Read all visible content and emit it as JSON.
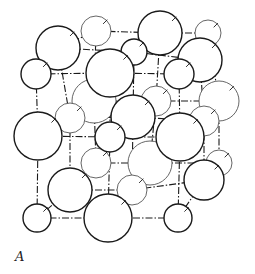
{
  "figure": {
    "label": "A",
    "stroke_color": "#1a1a1a",
    "thin_stroke_color": "#555555"
  },
  "bonds": [
    [
      36,
      74,
      110,
      73
    ],
    [
      110,
      73,
      179,
      74
    ],
    [
      36,
      74,
      38,
      136
    ],
    [
      110,
      73,
      110,
      137
    ],
    [
      179,
      74,
      180,
      137
    ],
    [
      38,
      136,
      110,
      137
    ],
    [
      110,
      137,
      180,
      137
    ],
    [
      38,
      136,
      37,
      218
    ],
    [
      110,
      137,
      108,
      218
    ],
    [
      180,
      137,
      178,
      218
    ],
    [
      37,
      218,
      108,
      218
    ],
    [
      108,
      218,
      178,
      218
    ],
    [
      58,
      48,
      134,
      52
    ],
    [
      134,
      52,
      200,
      60
    ],
    [
      96,
      31,
      160,
      33
    ],
    [
      160,
      33,
      208,
      33
    ],
    [
      58,
      48,
      96,
      31
    ],
    [
      134,
      52,
      160,
      33
    ],
    [
      200,
      60,
      208,
      33
    ],
    [
      94,
      101,
      156,
      101
    ],
    [
      156,
      101,
      219,
      101
    ],
    [
      70,
      118,
      133,
      117
    ],
    [
      133,
      117,
      204,
      121
    ],
    [
      58,
      48,
      70,
      118
    ],
    [
      134,
      52,
      133,
      117
    ],
    [
      200,
      60,
      204,
      121
    ],
    [
      96,
      31,
      94,
      101
    ],
    [
      160,
      33,
      156,
      101
    ],
    [
      208,
      33,
      219,
      101
    ],
    [
      70,
      118,
      70,
      190
    ],
    [
      133,
      117,
      132,
      190
    ],
    [
      204,
      121,
      204,
      180
    ],
    [
      94,
      101,
      96,
      163
    ],
    [
      156,
      101,
      150,
      163
    ],
    [
      219,
      101,
      219,
      163
    ],
    [
      70,
      190,
      132,
      190
    ],
    [
      132,
      190,
      204,
      180
    ],
    [
      96,
      163,
      150,
      163
    ],
    [
      150,
      163,
      219,
      163
    ],
    [
      36,
      74,
      58,
      48
    ],
    [
      110,
      73,
      134,
      52
    ],
    [
      179,
      74,
      200,
      60
    ],
    [
      38,
      136,
      70,
      118
    ],
    [
      110,
      137,
      133,
      117
    ],
    [
      180,
      137,
      204,
      121
    ],
    [
      37,
      218,
      70,
      190
    ],
    [
      108,
      218,
      132,
      190
    ],
    [
      178,
      218,
      204,
      180
    ]
  ],
  "atoms": [
    {
      "cx": 96,
      "cy": 31,
      "r": 15,
      "layer": "back",
      "weight": "thin"
    },
    {
      "cx": 208,
      "cy": 33,
      "r": 13,
      "layer": "back",
      "weight": "thin"
    },
    {
      "cx": 160,
      "cy": 33,
      "r": 22,
      "layer": "back",
      "weight": "bold"
    },
    {
      "cx": 94,
      "cy": 101,
      "r": 22,
      "layer": "back",
      "weight": "thin"
    },
    {
      "cx": 156,
      "cy": 101,
      "r": 15,
      "layer": "back",
      "weight": "thin"
    },
    {
      "cx": 219,
      "cy": 101,
      "r": 20,
      "layer": "back",
      "weight": "thin"
    },
    {
      "cx": 96,
      "cy": 163,
      "r": 15,
      "layer": "back",
      "weight": "thin"
    },
    {
      "cx": 150,
      "cy": 163,
      "r": 22,
      "layer": "back",
      "weight": "thin"
    },
    {
      "cx": 219,
      "cy": 163,
      "r": 13,
      "layer": "back",
      "weight": "thin"
    },
    {
      "cx": 58,
      "cy": 48,
      "r": 22,
      "layer": "mid",
      "weight": "bold"
    },
    {
      "cx": 134,
      "cy": 52,
      "r": 13,
      "layer": "mid",
      "weight": "bold"
    },
    {
      "cx": 200,
      "cy": 60,
      "r": 22,
      "layer": "mid",
      "weight": "bold"
    },
    {
      "cx": 70,
      "cy": 118,
      "r": 15,
      "layer": "mid",
      "weight": "thin"
    },
    {
      "cx": 133,
      "cy": 117,
      "r": 22,
      "layer": "mid",
      "weight": "bold"
    },
    {
      "cx": 204,
      "cy": 121,
      "r": 15,
      "layer": "mid",
      "weight": "thin"
    },
    {
      "cx": 70,
      "cy": 190,
      "r": 22,
      "layer": "mid",
      "weight": "bold"
    },
    {
      "cx": 132,
      "cy": 190,
      "r": 15,
      "layer": "mid",
      "weight": "thin"
    },
    {
      "cx": 204,
      "cy": 180,
      "r": 20,
      "layer": "mid",
      "weight": "bold"
    },
    {
      "cx": 36,
      "cy": 74,
      "r": 15,
      "layer": "front",
      "weight": "bold"
    },
    {
      "cx": 110,
      "cy": 73,
      "r": 24,
      "layer": "front",
      "weight": "bold"
    },
    {
      "cx": 179,
      "cy": 74,
      "r": 15,
      "layer": "front",
      "weight": "bold"
    },
    {
      "cx": 38,
      "cy": 136,
      "r": 24,
      "layer": "front",
      "weight": "bold"
    },
    {
      "cx": 110,
      "cy": 137,
      "r": 15,
      "layer": "front",
      "weight": "bold"
    },
    {
      "cx": 180,
      "cy": 137,
      "r": 24,
      "layer": "front",
      "weight": "bold"
    },
    {
      "cx": 37,
      "cy": 218,
      "r": 14,
      "layer": "front",
      "weight": "bold"
    },
    {
      "cx": 108,
      "cy": 218,
      "r": 24,
      "layer": "front",
      "weight": "bold"
    },
    {
      "cx": 178,
      "cy": 218,
      "r": 14,
      "layer": "front",
      "weight": "bold"
    }
  ]
}
